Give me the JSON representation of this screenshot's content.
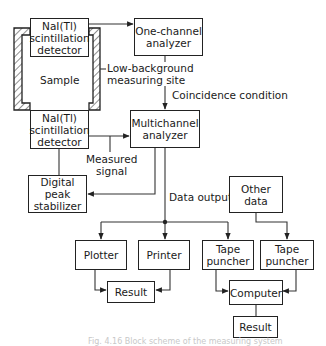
{
  "diagram": {
    "type": "block-scheme",
    "nodes": {
      "detector_top": "NaI(Tl)\nscintillation\ndetector",
      "detector_bottom": "NaI(Tl)\nscintillation\ndetector",
      "sample": "Sample",
      "one_channel_analyzer": "One-channel\nanalyzer",
      "multichannel_analyzer": "Multichannel\nanalyzer",
      "digital_peak_stabilizer": "Digital\npeak\nstabilizer",
      "other_data": "Other\ndata",
      "plotter": "Plotter",
      "printer": "Printer",
      "tape_puncher_1": "Tape\npuncher",
      "tape_puncher_2": "Tape\npuncher",
      "result_1": "Result",
      "computer": "Computer",
      "result_2": "Result"
    },
    "annotations": {
      "low_background_site": "Low-background\nmeasuring site",
      "coincidence_condition": "Coincidence condition",
      "measured_signal": "Measured\nsignal",
      "data_output": "Data output"
    },
    "edges": [
      {
        "from": "detector_top",
        "to": "one_channel_analyzer"
      },
      {
        "from": "one_channel_analyzer",
        "to": "multichannel_analyzer",
        "label": "Coincidence condition"
      },
      {
        "from": "detector_bottom",
        "to": "multichannel_analyzer",
        "label": "Measured signal"
      },
      {
        "from": "multichannel_analyzer",
        "to": "digital_peak_stabilizer"
      },
      {
        "from": "digital_peak_stabilizer",
        "to": "detector_bottom"
      },
      {
        "from": "multichannel_analyzer",
        "to": "plotter",
        "label": "Data output"
      },
      {
        "from": "multichannel_analyzer",
        "to": "printer"
      },
      {
        "from": "multichannel_analyzer",
        "to": "tape_puncher_1"
      },
      {
        "from": "other_data",
        "to": "tape_puncher_2"
      },
      {
        "from": "plotter",
        "to": "result_1"
      },
      {
        "from": "printer",
        "to": "result_1"
      },
      {
        "from": "tape_puncher_1",
        "to": "computer"
      },
      {
        "from": "tape_puncher_2",
        "to": "computer"
      },
      {
        "from": "computer",
        "to": "result_2"
      }
    ],
    "caption": "Fig. 4.16 Block scheme of the measuring system"
  }
}
